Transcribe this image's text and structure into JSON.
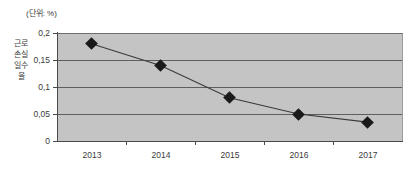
{
  "caption": {
    "unit_label": "(단위: %)"
  },
  "axis": {
    "y_title": "근로손실일수율",
    "y_ticks": [
      "0,2",
      "0,15",
      "0,1",
      "0,05",
      "0"
    ],
    "x_ticks": [
      "2013",
      "2014",
      "2015",
      "2016",
      "2017"
    ]
  },
  "colors": {
    "plot_background": "#c4c4c4",
    "gridline": "#5e5e5e",
    "axis": "#4a4a4a",
    "marker": "#1a1a1a",
    "series_line": "#3a3a3a",
    "text": "#3a3a3a",
    "page_background": "#ffffff"
  },
  "chart_data": {
    "type": "line",
    "title": "",
    "subtitle": "",
    "xlabel": "",
    "ylabel": "근로손실일수율",
    "unit": "%",
    "categories": [
      "2013",
      "2014",
      "2015",
      "2016",
      "2017"
    ],
    "values": [
      0.18,
      0.14,
      0.08,
      0.05,
      0.035
    ],
    "series": [
      {
        "name": "근로손실일수율",
        "values": [
          0.18,
          0.14,
          0.08,
          0.05,
          0.035
        ]
      }
    ],
    "ylim": [
      0,
      0.2
    ],
    "yticks": [
      0,
      0.05,
      0.1,
      0.15,
      0.2
    ],
    "ytick_labels": [
      "0",
      "0,05",
      "0,1",
      "0,15",
      "0,2"
    ],
    "grid": true,
    "grid_axis": "y",
    "legend": false,
    "legend_position": "none",
    "markers": "diamond",
    "annotations": [
      "(단위: %)"
    ]
  }
}
